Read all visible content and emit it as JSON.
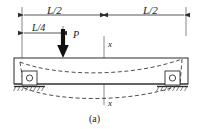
{
  "figure": {
    "caption": "(a)",
    "type": "beam-loading-deflection-diagram",
    "colors": {
      "line": "#2b2b2b",
      "dashed": "#3a3a3a",
      "background": "#ffffff",
      "arrow_fill": "#111111"
    },
    "labels": {
      "span_left": "L/2",
      "span_right": "L/2",
      "load_offset": "L/4",
      "load_force": "P",
      "axis_top": "x",
      "axis_bottom": "x"
    },
    "dimensions": [
      {
        "name": "left-half-span",
        "label": "L/2",
        "from_px": 22,
        "to_px": 104,
        "y_px": 15
      },
      {
        "name": "right-half-span",
        "label": "L/2",
        "from_px": 104,
        "to_px": 186,
        "y_px": 15
      },
      {
        "name": "quarter-span",
        "label": "L/4",
        "from_px": 22,
        "to_px": 63,
        "y_px": 33
      }
    ],
    "load": {
      "name": "point-load-P",
      "label": "P",
      "x_px": 63,
      "head_y_px": 57,
      "tail_y_px": 29,
      "direction": "down"
    },
    "beam": {
      "left_px": 14,
      "right_px": 188,
      "top_px": 58,
      "bottom_px": 84,
      "deflected": true
    },
    "supports": [
      {
        "name": "roller-support-left",
        "x_px": 28,
        "y_px": 85
      },
      {
        "name": "roller-support-right",
        "x_px": 172,
        "y_px": 85
      }
    ],
    "centerline": {
      "name": "section-axis-x-x",
      "x_px": 104,
      "top_px": 36,
      "bottom_px": 105
    }
  }
}
